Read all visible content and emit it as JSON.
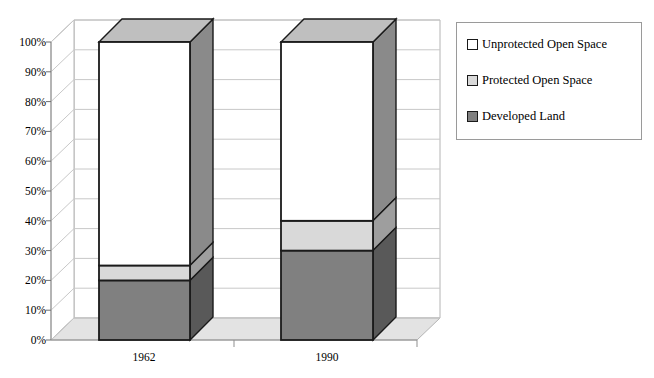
{
  "chart_data": {
    "type": "bar",
    "subtype": "stacked-3d",
    "title": "",
    "xlabel": "",
    "ylabel": "",
    "categories": [
      "1962",
      "1990"
    ],
    "ylim": [
      0,
      100
    ],
    "ytick_labels": [
      "0%",
      "10%",
      "20%",
      "30%",
      "40%",
      "50%",
      "60%",
      "70%",
      "80%",
      "90%",
      "100%"
    ],
    "ytick_values": [
      0,
      10,
      20,
      30,
      40,
      50,
      60,
      70,
      80,
      90,
      100
    ],
    "grid": true,
    "grid_axis": "y",
    "legend_position": "right",
    "stack_order_bottom_to_top": [
      "Developed Land",
      "Protected Open Space",
      "Unprotected Open Space"
    ],
    "series": [
      {
        "name": "Developed Land",
        "color": "#808080",
        "values": [
          20,
          30
        ],
        "cumulative_top": [
          20,
          30
        ]
      },
      {
        "name": "Protected Open Space",
        "color": "#d9d9d9",
        "values": [
          5,
          10
        ],
        "cumulative_top": [
          25,
          40
        ]
      },
      {
        "name": "Unprotected Open Space",
        "color": "#ffffff",
        "values": [
          75,
          60
        ],
        "cumulative_top": [
          100,
          100
        ]
      }
    ],
    "annotations": []
  },
  "axis": {
    "y_ticks": [
      {
        "label": "100%"
      },
      {
        "label": "90%"
      },
      {
        "label": "80%"
      },
      {
        "label": "70%"
      },
      {
        "label": "60%"
      },
      {
        "label": "50%"
      },
      {
        "label": "40%"
      },
      {
        "label": "30%"
      },
      {
        "label": "20%"
      },
      {
        "label": "10%"
      },
      {
        "label": "0%"
      }
    ],
    "x_ticks": [
      {
        "label": "1962"
      },
      {
        "label": "1990"
      }
    ]
  },
  "legend": {
    "items": [
      {
        "label": "Unprotected Open Space",
        "color": "#ffffff"
      },
      {
        "label": "Protected Open Space",
        "color": "#d9d9d9"
      },
      {
        "label": "Developed Land",
        "color": "#808080"
      }
    ]
  },
  "colors": {
    "developed_land": "#808080",
    "protected_open_space": "#d9d9d9",
    "unprotected_open_space": "#ffffff",
    "side_face_developed": "#595959",
    "side_face_protected": "#9e9e9e",
    "side_face_unprotected": "#8a8a8a",
    "top_face": "#bfbfbf",
    "floor": "#e3e3e3",
    "gridline": "#c8c8c8",
    "wall_line": "#b4b4b4",
    "outline": "#1a1a1a",
    "legend_border": "#9a9a9a"
  }
}
